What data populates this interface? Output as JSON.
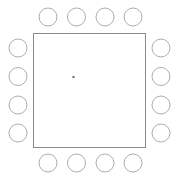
{
  "canvas": {
    "width": 176,
    "height": 176,
    "background": "#ffffff"
  },
  "diagram": {
    "kind": "ic-package-footprint",
    "body": {
      "shape": "square",
      "x": 33.5,
      "y": 33.5,
      "width": 112,
      "height": 114,
      "fill": "#ffffff",
      "stroke": "#8a8a8a",
      "stroke_width": 1
    },
    "center_mark": {
      "shape": "dot",
      "cx": 73.5,
      "cy": 77,
      "size": 2,
      "fill": "#6a6a6a"
    },
    "pad": {
      "shape": "circle",
      "radius": 9,
      "fill": "#ffffff",
      "stroke": "#adadad",
      "stroke_width": 1
    },
    "pad_count_total": 16,
    "pads_per_side": 4,
    "sides": [
      {
        "name": "top",
        "pads": [
          {
            "id": "top-1",
            "cx": 48,
            "cy": 17
          },
          {
            "id": "top-2",
            "cx": 76.5,
            "cy": 17
          },
          {
            "id": "top-3",
            "cx": 105,
            "cy": 17
          },
          {
            "id": "top-4",
            "cx": 133,
            "cy": 17
          }
        ]
      },
      {
        "name": "left",
        "pads": [
          {
            "id": "left-1",
            "cx": 18,
            "cy": 48
          },
          {
            "id": "left-2",
            "cx": 18,
            "cy": 76.5
          },
          {
            "id": "left-3",
            "cx": 18,
            "cy": 105
          },
          {
            "id": "left-4",
            "cx": 18,
            "cy": 133
          }
        ]
      },
      {
        "name": "right",
        "pads": [
          {
            "id": "right-1",
            "cx": 161,
            "cy": 48
          },
          {
            "id": "right-2",
            "cx": 161,
            "cy": 76.5
          },
          {
            "id": "right-3",
            "cx": 161,
            "cy": 105
          },
          {
            "id": "right-4",
            "cx": 161,
            "cy": 133
          }
        ]
      },
      {
        "name": "bottom",
        "pads": [
          {
            "id": "bottom-1",
            "cx": 48,
            "cy": 163
          },
          {
            "id": "bottom-2",
            "cx": 76.5,
            "cy": 163
          },
          {
            "id": "bottom-3",
            "cx": 105,
            "cy": 163
          },
          {
            "id": "bottom-4",
            "cx": 133,
            "cy": 163
          }
        ]
      }
    ]
  }
}
